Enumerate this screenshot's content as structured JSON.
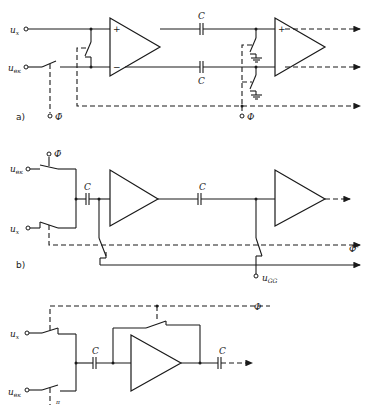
{
  "figure": {
    "panels": [
      {
        "id": "a",
        "label": "a)",
        "inputs": [
          {
            "name": "u",
            "sub": "x"
          },
          {
            "name": "u",
            "sub": "вк"
          }
        ],
        "capacitor_labels": [
          "C",
          "C"
        ],
        "clock_labels": [
          "Φ̄",
          "Φ"
        ],
        "amplifier_signs": [
          "+",
          "−"
        ]
      },
      {
        "id": "b",
        "label": "b)",
        "inputs": [
          {
            "name": "u",
            "sub": "вк"
          },
          {
            "name": "u",
            "sub": "x"
          }
        ],
        "capacitor_labels": [
          "C",
          "C"
        ],
        "clock_labels": [
          "Φ̄",
          "Φ'"
        ],
        "bias_label": {
          "name": "u",
          "sub": "GG"
        }
      },
      {
        "id": "c",
        "inputs": [
          {
            "name": "u",
            "sub": "x"
          },
          {
            "name": "u",
            "sub": "вк"
          }
        ],
        "capacitor_labels": [
          "C",
          "C"
        ],
        "clock_labels": [
          "Φ",
          "π"
        ]
      }
    ]
  }
}
